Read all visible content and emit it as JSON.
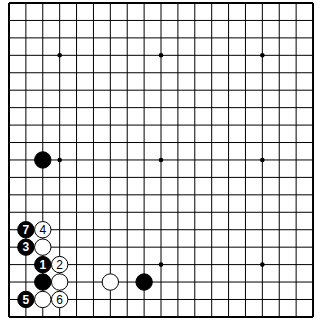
{
  "board": {
    "size": 19,
    "visible_cols": 19,
    "visible_rows": 19,
    "origin_x": 9,
    "origin_y": 3,
    "spacing_x": 16.89,
    "spacing_y": 17.44,
    "line_color": "#000000",
    "background": "#ffffff",
    "star_points": [
      [
        3,
        3
      ],
      [
        9,
        3
      ],
      [
        15,
        3
      ],
      [
        3,
        9
      ],
      [
        9,
        9
      ],
      [
        15,
        9
      ],
      [
        3,
        15
      ],
      [
        9,
        15
      ],
      [
        15,
        15
      ]
    ]
  },
  "stones": [
    {
      "color": "black",
      "col": 2,
      "row": 9,
      "label": ""
    },
    {
      "color": "black",
      "col": 1,
      "row": 13,
      "label": "7"
    },
    {
      "color": "white",
      "col": 2,
      "row": 13,
      "label": "4"
    },
    {
      "color": "black",
      "col": 1,
      "row": 14,
      "label": "3"
    },
    {
      "color": "white",
      "col": 2,
      "row": 14,
      "label": ""
    },
    {
      "color": "black",
      "col": 2,
      "row": 15,
      "label": "1"
    },
    {
      "color": "white",
      "col": 3,
      "row": 15,
      "label": "2"
    },
    {
      "color": "black",
      "col": 2,
      "row": 16,
      "label": ""
    },
    {
      "color": "white",
      "col": 3,
      "row": 16,
      "label": ""
    },
    {
      "color": "white",
      "col": 6,
      "row": 16,
      "label": ""
    },
    {
      "color": "black",
      "col": 8,
      "row": 16,
      "label": ""
    },
    {
      "color": "black",
      "col": 1,
      "row": 17,
      "label": "5"
    },
    {
      "color": "white",
      "col": 2,
      "row": 17,
      "label": ""
    },
    {
      "color": "white",
      "col": 3,
      "row": 17,
      "label": "6"
    }
  ]
}
